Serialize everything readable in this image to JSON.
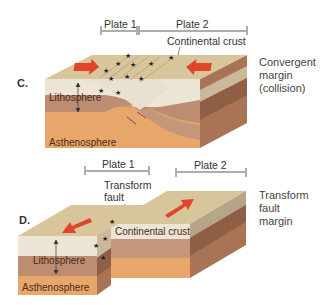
{
  "panels": [
    {
      "letter": "C.",
      "plate1": "Plate 1",
      "plate2": "Plate 2",
      "crust_label": "Continental crust",
      "lithosphere": "Lithosphere",
      "asthenosphere": "Asthenosphere",
      "margin_line1": "Convergent",
      "margin_line2": "margin",
      "margin_line3": "(collision)"
    },
    {
      "letter": "D.",
      "plate1": "Plate 1",
      "plate2": "Plate 2",
      "fault_line1": "Transform",
      "fault_line2": "fault",
      "crust_label": "Continental crust",
      "lithosphere": "Lithosphere",
      "asthenosphere": "Asthenosphere",
      "margin_line1": "Transform",
      "margin_line2": "fault",
      "margin_line3": "margin"
    }
  ],
  "colors": {
    "surface": "#d8c59c",
    "crust": "#ede6d6",
    "lithosphere": "#b98a6e",
    "asthenosphere": "#e8a76a",
    "arrow": "#e0442a"
  }
}
